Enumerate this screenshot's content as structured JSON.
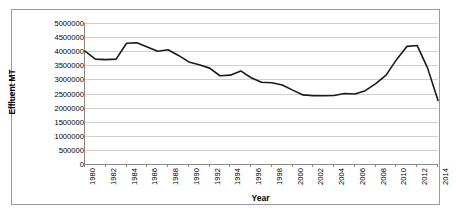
{
  "chart_data": {
    "type": "line",
    "title": "",
    "xlabel": "Year",
    "ylabel": "Effluent MT",
    "xlim": [
      1980,
      2014
    ],
    "ylim": [
      0,
      5000000
    ],
    "grid": true,
    "legend": false,
    "y_ticks": [
      "5000000",
      "4500000",
      "4000000",
      "3500000",
      "3000000",
      "2500000",
      "2000000",
      "1500000",
      "1000000",
      "500000",
      "0"
    ],
    "y_tick_values": [
      5000000,
      4500000,
      4000000,
      3500000,
      3000000,
      2500000,
      2000000,
      1500000,
      1000000,
      500000,
      0
    ],
    "x_tick_labels": [
      "1980",
      "1982",
      "1984",
      "1986",
      "1988",
      "1990",
      "1992",
      "1994",
      "1996",
      "1998",
      "2000",
      "2002",
      "2004",
      "2006",
      "2008",
      "2010",
      "2012",
      "2014"
    ],
    "x": [
      1980,
      1981,
      1982,
      1983,
      1984,
      1985,
      1986,
      1987,
      1988,
      1989,
      1990,
      1991,
      1992,
      1993,
      1994,
      1995,
      1996,
      1997,
      1998,
      1999,
      2000,
      2001,
      2002,
      2003,
      2004,
      2005,
      2006,
      2007,
      2008,
      2009,
      2010,
      2011,
      2012,
      2013,
      2014
    ],
    "values": [
      4000000,
      3720000,
      3700000,
      3720000,
      4280000,
      4300000,
      4150000,
      4000000,
      4050000,
      3850000,
      3620000,
      3520000,
      3400000,
      3130000,
      3150000,
      3300000,
      3060000,
      2900000,
      2880000,
      2800000,
      2620000,
      2450000,
      2420000,
      2420000,
      2430000,
      2500000,
      2480000,
      2600000,
      2850000,
      3150000,
      3700000,
      4170000,
      4200000,
      3400000,
      2250000
    ],
    "series_color": "#1a1a1a",
    "grid_color": "#d0d0d0",
    "axis_color": "#868686",
    "border_color": "#9a9a9a"
  }
}
